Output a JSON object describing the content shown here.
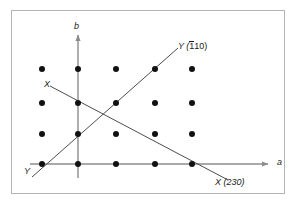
{
  "figure": {
    "type": "crystallographic-lattice-diagram",
    "frame": {
      "x": 11,
      "y": 10,
      "width": 274,
      "height": 184,
      "border_color": "#b3b3b3"
    },
    "axes": {
      "color": "#8c8c8c",
      "origin": {
        "x": 78,
        "y": 164
      },
      "a_axis": {
        "label": "a",
        "from": {
          "x": 30,
          "y": 164
        },
        "to": {
          "x": 272,
          "y": 164
        },
        "arrow": true
      },
      "b_axis": {
        "label": "b",
        "from": {
          "x": 78,
          "y": 178
        },
        "to": {
          "x": 78,
          "y": 31
        },
        "arrow": true
      }
    },
    "lattice": {
      "dot_color": "#111111",
      "dot_radius": 3,
      "columns_x": [
        42,
        78,
        116,
        155,
        192
      ],
      "rows_y": [
        69,
        103,
        134,
        164
      ],
      "count": 20
    },
    "traces": [
      {
        "name": "X-trace",
        "miller_index": "(230)",
        "label_near": "X",
        "label_far": "X (230)",
        "color": "#4d4d4d",
        "from": {
          "x": 50,
          "y": 86
        },
        "to": {
          "x": 228,
          "y": 180
        }
      },
      {
        "name": "Y-trace",
        "miller_index": "(110)",
        "miller_index_bar_digit": "1",
        "label_near": "Y",
        "label_far_prefix": "Y (",
        "label_far_bar": "1",
        "label_far_rest": "10)",
        "color": "#4d4d4d",
        "from": {
          "x": 32,
          "y": 177
        },
        "to": {
          "x": 178,
          "y": 48
        }
      }
    ],
    "labels": {
      "axis_a": "a",
      "axis_b": "b",
      "x_near": "X",
      "y_near": "Y",
      "y_far_prefix": "Y (",
      "y_far_bar": "1",
      "y_far_rest": "10)",
      "x_far": "X (230)"
    }
  }
}
